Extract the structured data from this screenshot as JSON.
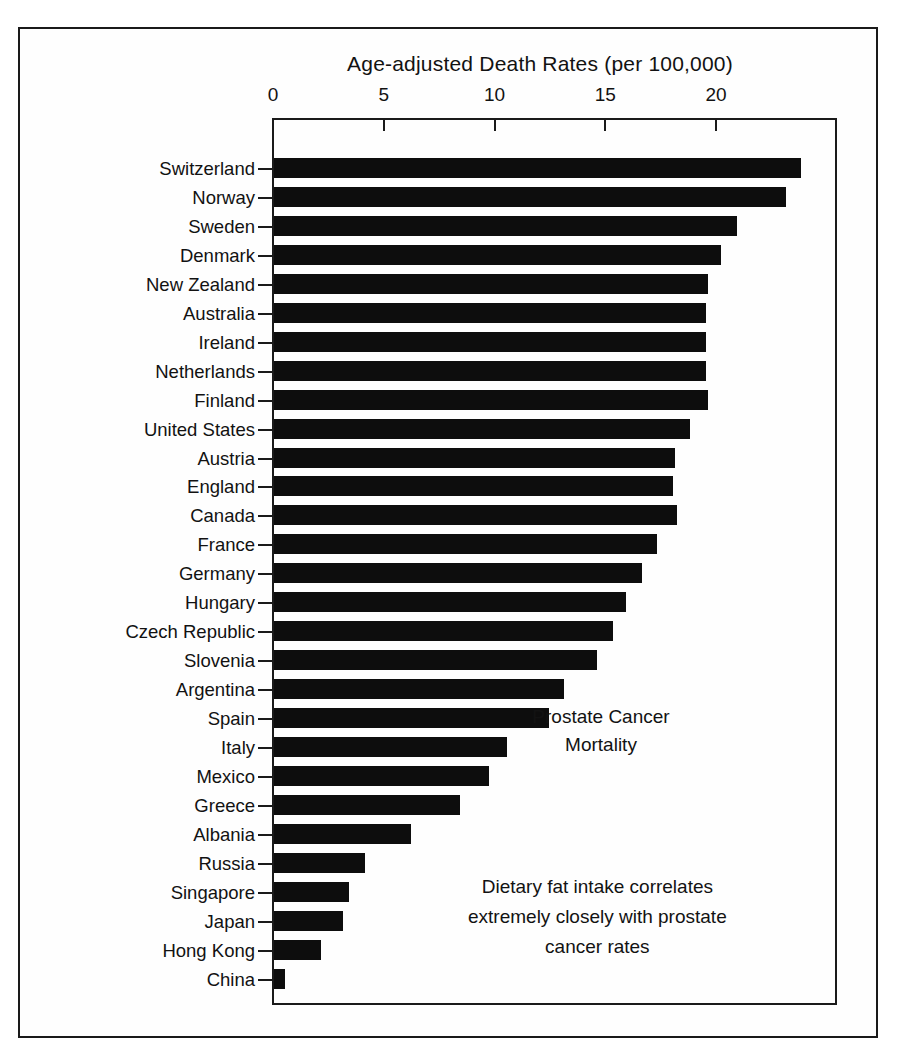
{
  "chart_data": {
    "type": "bar",
    "orientation": "horizontal",
    "title": "Age-adjusted Death Rates (per 100,000)",
    "xlabel": "Age-adjusted Death Rates (per 100,000)",
    "ylabel": "",
    "xlim": [
      0,
      25.5
    ],
    "xticks": [
      0,
      5,
      10,
      15,
      20
    ],
    "xtick_labels": [
      "0",
      "5",
      "10",
      "15",
      "20"
    ],
    "grid": false,
    "legend": null,
    "bar_color": "#0d0d0d",
    "categories": [
      "Switzerland",
      "Norway",
      "Sweden",
      "Denmark",
      "New Zealand",
      "Australia",
      "Ireland",
      "Netherlands",
      "Finland",
      "United States",
      "Austria",
      "England",
      "Canada",
      "France",
      "Germany",
      "Hungary",
      "Czech Republic",
      "Slovenia",
      "Argentina",
      "Spain",
      "Italy",
      "Mexico",
      "Greece",
      "Albania",
      "Russia",
      "Singapore",
      "Japan",
      "Hong Kong",
      "China"
    ],
    "values": [
      23.8,
      23.1,
      20.9,
      20.2,
      19.6,
      19.5,
      19.5,
      19.5,
      19.6,
      18.8,
      18.1,
      18.0,
      18.2,
      17.3,
      16.6,
      15.9,
      15.3,
      14.6,
      13.1,
      12.4,
      10.5,
      9.7,
      8.4,
      6.2,
      4.1,
      3.4,
      3.1,
      2.1,
      0.5
    ],
    "annotations": [
      "Prostate Cancer\nMortality",
      "Dietary fat intake correlates\nextremely closely with prostate\ncancer rates"
    ]
  },
  "annotations": {
    "mortality": "Prostate Cancer\nMortality",
    "diet": "Dietary fat intake correlates\nextremely closely with prostate\ncancer rates"
  }
}
